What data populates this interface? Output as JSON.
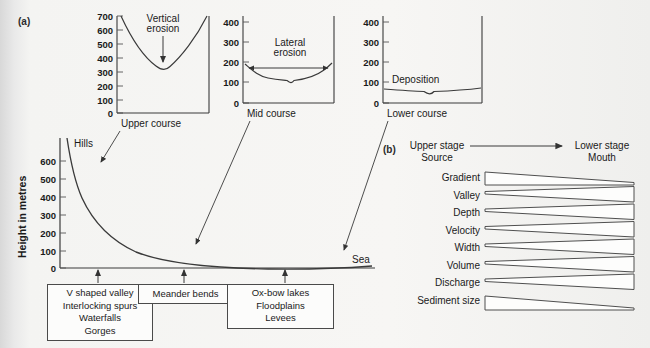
{
  "figure": {
    "panel_a_tag": "(a)",
    "panel_b_tag": "(b)"
  },
  "long_profile": {
    "y_axis_title": "Height in metres",
    "y_ticks": [
      0,
      100,
      200,
      300,
      400,
      500,
      600
    ],
    "start_label": "Hills",
    "end_label": "Sea",
    "curve_description": "concave river long profile from 650 m at source to 0 m at sea",
    "curve_points": [
      {
        "x": 0,
        "y": 650
      },
      {
        "x": 4,
        "y": 560
      },
      {
        "x": 8,
        "y": 480
      },
      {
        "x": 14,
        "y": 400
      },
      {
        "x": 22,
        "y": 330
      },
      {
        "x": 32,
        "y": 265
      },
      {
        "x": 44,
        "y": 205
      },
      {
        "x": 56,
        "y": 155
      },
      {
        "x": 68,
        "y": 110
      },
      {
        "x": 80,
        "y": 70
      },
      {
        "x": 90,
        "y": 40
      },
      {
        "x": 100,
        "y": 10
      }
    ],
    "feature_boxes": [
      {
        "id": "upper",
        "lines": [
          "V shaped valley",
          "Interlocking spurs",
          "Waterfalls",
          "Gorges"
        ]
      },
      {
        "id": "middle",
        "lines": [
          "Meander bends"
        ]
      },
      {
        "id": "lower",
        "lines": [
          "Ox-bow lakes",
          "Floodplains",
          "Levees"
        ]
      }
    ]
  },
  "cross_sections": [
    {
      "id": "upper-course",
      "caption": "Upper course",
      "annotation": "Vertical erosion",
      "arrow_type": "down-arrow",
      "y_ticks": [
        0,
        100,
        200,
        300,
        400,
        500,
        600,
        700
      ],
      "valley_shape": "narrow V-shaped, floor at about 355 m, rims at 700 m"
    },
    {
      "id": "mid-course",
      "caption": "Mid course",
      "annotation": "Lateral erosion",
      "arrow_type": "double-headed-horizontal-arrow",
      "y_ticks": [
        0,
        100,
        200,
        300,
        400
      ],
      "valley_shape": "wide open valley, floor near 115 m, rims at about 190 m"
    },
    {
      "id": "lower-course",
      "caption": "Lower course",
      "annotation": "Deposition",
      "arrow_type": "none",
      "y_ticks": [
        0,
        100,
        200,
        300,
        400
      ],
      "valley_shape": "very wide flat floodplain, floor near 65 m"
    }
  ],
  "variables_panel": {
    "left_heading_line1": "Upper stage",
    "left_heading_line2": "Source",
    "right_heading_line1": "Lower stage",
    "right_heading_line2": "Mouth",
    "arrow": "right-arrow",
    "rows": [
      {
        "label": "Gradient",
        "trend": "decrease"
      },
      {
        "label": "Valley",
        "trend": "increase"
      },
      {
        "label": "Depth",
        "trend": "increase"
      },
      {
        "label": "Velocity",
        "trend": "increase"
      },
      {
        "label": "Width",
        "trend": "increase"
      },
      {
        "label": "Volume",
        "trend": "increase"
      },
      {
        "label": "Discharge",
        "trend": "increase"
      },
      {
        "label": "Sediment size",
        "trend": "decrease"
      }
    ]
  }
}
